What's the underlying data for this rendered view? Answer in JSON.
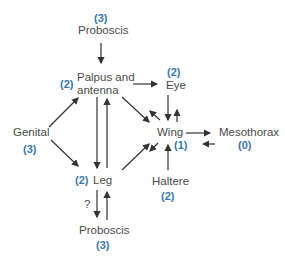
{
  "nodes": {
    "proboscis_top": {
      "label": "Proboscis",
      "level": "(3)"
    },
    "palpus": {
      "label_line1": "Palpus and",
      "label_line2": "antenna",
      "level": "(2)"
    },
    "eye": {
      "label": "Eye",
      "level": "(2)"
    },
    "genital": {
      "label": "Genital",
      "level": "(3)"
    },
    "wing": {
      "label": "Wing",
      "level": "(1)"
    },
    "mesothorax": {
      "label": "Mesothorax",
      "level": "(0)"
    },
    "leg": {
      "label": "Leg",
      "level": "(2)"
    },
    "haltere": {
      "label": "Haltere",
      "level": "(2)"
    },
    "proboscis_bottom": {
      "label": "Proboscis",
      "level": "(3)"
    }
  },
  "annotations": {
    "question_mark": "?"
  },
  "edges": [
    {
      "from": "Proboscis (top)",
      "to": "Palpus and antenna"
    },
    {
      "from": "Palpus and antenna",
      "to": "Eye"
    },
    {
      "from": "Palpus and antenna",
      "to": "Wing"
    },
    {
      "from": "Wing",
      "to": "Palpus and antenna"
    },
    {
      "from": "Palpus and antenna",
      "to": "Leg"
    },
    {
      "from": "Leg",
      "to": "Palpus and antenna"
    },
    {
      "from": "Genital",
      "to": "Palpus and antenna"
    },
    {
      "from": "Genital",
      "to": "Leg"
    },
    {
      "from": "Eye",
      "to": "Wing"
    },
    {
      "from": "Wing",
      "to": "Eye"
    },
    {
      "from": "Wing",
      "to": "Mesothorax"
    },
    {
      "from": "Mesothorax",
      "to": "Wing"
    },
    {
      "from": "Leg",
      "to": "Wing"
    },
    {
      "from": "Wing",
      "to": "Leg"
    },
    {
      "from": "Haltere",
      "to": "Wing"
    },
    {
      "from": "Leg",
      "to": "Proboscis (bottom)",
      "note": "?"
    },
    {
      "from": "Proboscis (bottom)",
      "to": "Leg"
    }
  ],
  "colors": {
    "label": "#4a4a4a",
    "level": "#3a78a8",
    "arrow": "#333333"
  }
}
